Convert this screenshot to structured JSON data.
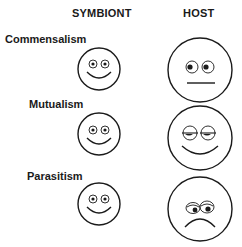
{
  "headers": {
    "symbiont": "SYMBIONT",
    "host": "HOST"
  },
  "rows": [
    {
      "label": "Commensalism",
      "symbiont_expression": "happy",
      "host_expression": "neutral"
    },
    {
      "label": "Mutualism",
      "symbiont_expression": "happy",
      "host_expression": "content-sleepy-smile"
    },
    {
      "label": "Parasitism",
      "symbiont_expression": "happy",
      "host_expression": "sad"
    }
  ],
  "colors": {
    "stroke": "#1a1a1a",
    "background": "#ffffff"
  }
}
